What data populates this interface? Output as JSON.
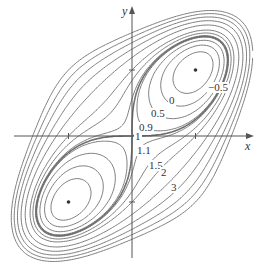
{
  "chart_data": {
    "type": "contour",
    "title": "",
    "function": "f(x,y) = x^4 + y^4 - 4xy + 1",
    "xlabel": "x",
    "ylabel": "y",
    "xlim": [
      -2.1,
      1.9
    ],
    "ylim": [
      -2.0,
      2.1
    ],
    "x_ticks": [
      -1,
      1
    ],
    "y_ticks": [
      -1,
      1
    ],
    "levels": [
      -0.5,
      0,
      0.5,
      0.9,
      1,
      1.1,
      1.5,
      2,
      3,
      4,
      5,
      6,
      7
    ],
    "labeled_levels": [
      "-0.5",
      "0",
      "0.5",
      "0.9",
      "1",
      "1.1",
      "1.5",
      "2",
      "3"
    ],
    "critical_points": [
      {
        "x": 1,
        "y": 1,
        "type": "minimum",
        "value": -1
      },
      {
        "x": -1,
        "y": -1,
        "type": "minimum",
        "value": -1
      },
      {
        "x": 0,
        "y": 0,
        "type": "saddle",
        "value": 1
      }
    ],
    "grid": false,
    "legend": "none"
  },
  "labels": [
    {
      "text": "−0.5",
      "px": 207,
      "py": 82
    },
    {
      "text": "0",
      "px": 168,
      "py": 95
    },
    {
      "text": "0.5",
      "px": 150,
      "py": 108
    },
    {
      "text": "0.9",
      "px": 138,
      "py": 122
    },
    {
      "text": "1",
      "px": 134,
      "py": 131
    },
    {
      "text": "1.1",
      "px": 136,
      "py": 145
    },
    {
      "text": "1.5",
      "px": 148,
      "py": 160
    },
    {
      "text": "2",
      "px": 160,
      "py": 167
    },
    {
      "text": "3",
      "px": 170,
      "py": 182
    }
  ],
  "axes": {
    "x_label": "x",
    "y_label": "y"
  },
  "colors": {
    "line": "#6e6e6e",
    "axis": "#555555",
    "point": "#333333"
  },
  "pixel": {
    "ox": 132,
    "oy": 136,
    "sx": 63.5,
    "sy": 66
  }
}
